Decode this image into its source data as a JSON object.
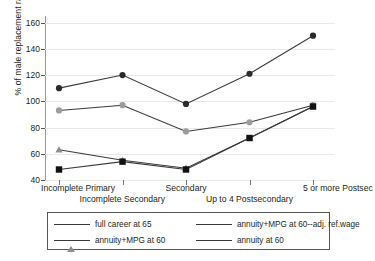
{
  "chart_data": {
    "type": "line",
    "title": "",
    "xlabel": "",
    "ylabel": "% of male replacement rates at 65",
    "ylim": [
      40,
      165
    ],
    "yticks": [
      40,
      60,
      80,
      100,
      120,
      140,
      160
    ],
    "ytick_labels": [
      "40",
      "60",
      "80",
      "100",
      "120",
      "140",
      "160"
    ],
    "grid": true,
    "legend_position": "below-plot",
    "categories": [
      "Incomplete Primary",
      "Incomplete Secondary",
      "Secondary",
      "Up to 4 Postsecondary",
      "5 or more Postsec"
    ],
    "series": [
      {
        "name": "full career at 65",
        "marker": "circle",
        "color": "#2b2b2b",
        "values": [
          110,
          120,
          98,
          121,
          150
        ]
      },
      {
        "name": "annuity+MPG at 60--adj. ref.wage",
        "marker": "circle-grey",
        "color": "#9d9d9d",
        "values": [
          93,
          97,
          77,
          84,
          97
        ]
      },
      {
        "name": "annuity+MPG at 60",
        "marker": "triangle",
        "color": "#8e8e8e",
        "values": [
          63,
          55,
          49,
          72,
          96
        ]
      },
      {
        "name": "annuity at 60",
        "marker": "square",
        "color": "#111111",
        "values": [
          48,
          54,
          48,
          72,
          96
        ]
      }
    ]
  },
  "legend": {
    "items": [
      {
        "label": "full career at 65",
        "marker": "circle"
      },
      {
        "label": "annuity+MPG at 60--adj. ref.wage",
        "marker": "circle-grey"
      },
      {
        "label": "annuity+MPG at 60",
        "marker": "triangle"
      },
      {
        "label": "annuity at 60",
        "marker": "square"
      }
    ]
  }
}
